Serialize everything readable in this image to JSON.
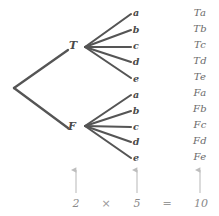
{
  "diagram": {
    "background_color": "#ffffff",
    "branch_color": "#555555",
    "label_color": "#4a4a4a",
    "outcome_color": "#6b6b6b",
    "arrow_color": "#bdbdbd",
    "equation_color": "#8a8a8a"
  },
  "root": {
    "label": "",
    "x": 14,
    "y": 88
  },
  "level1": {
    "nodes": [
      {
        "id": "T",
        "label": "T",
        "x": 73,
        "y": 45,
        "line_end_x": 68,
        "line_end_y": 50,
        "fan_x": 85,
        "fan_y": 47
      },
      {
        "id": "F",
        "label": "F",
        "x": 72,
        "y": 126,
        "line_end_x": 68,
        "line_end_y": 128,
        "fan_x": 85,
        "fan_y": 126
      }
    ]
  },
  "level2": {
    "labels": [
      "a",
      "b",
      "c",
      "d",
      "e"
    ],
    "branch_end_x": 131,
    "label_x": 136,
    "group_T_y": [
      14,
      30,
      47,
      62,
      78
    ],
    "group_F_y": [
      95,
      111,
      127,
      142,
      158
    ],
    "label_T_y": [
      13,
      30,
      46,
      62,
      79
    ],
    "label_F_y": [
      95,
      111,
      127,
      142,
      158
    ]
  },
  "outcomes": {
    "x": 200,
    "start_y": 13,
    "step_y": 16,
    "items": [
      "Ta",
      "Tb",
      "Tc",
      "Td",
      "Te",
      "Fa",
      "Fb",
      "Fc",
      "Fd",
      "Fe"
    ]
  },
  "arrows": [
    {
      "name": "arrow-level1-count",
      "x": 76,
      "top_y": 170,
      "bottom_y": 193
    },
    {
      "name": "arrow-level2-count",
      "x": 137,
      "top_y": 170,
      "bottom_y": 193
    },
    {
      "name": "arrow-outcomes-count",
      "x": 200,
      "top_y": 170,
      "bottom_y": 193
    }
  ],
  "equation": {
    "y": 203,
    "terms": [
      {
        "name": "factor-1",
        "text": "2",
        "x": 76,
        "kind": "term"
      },
      {
        "name": "multiply-operator",
        "text": "×",
        "x": 106,
        "kind": "op"
      },
      {
        "name": "factor-2",
        "text": "5",
        "x": 137,
        "kind": "term"
      },
      {
        "name": "equals-operator",
        "text": "=",
        "x": 167,
        "kind": "op"
      },
      {
        "name": "product",
        "text": "10",
        "x": 201,
        "kind": "term"
      }
    ]
  }
}
